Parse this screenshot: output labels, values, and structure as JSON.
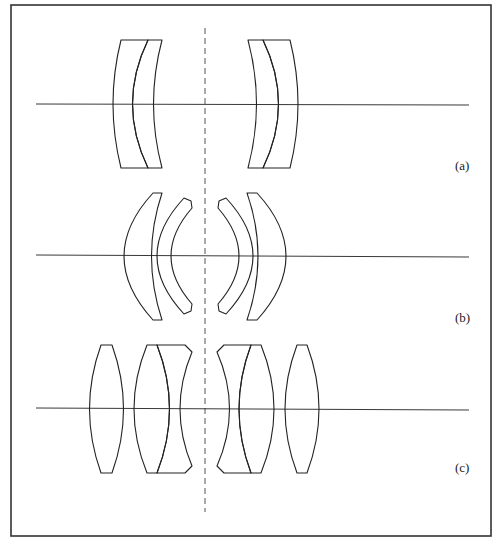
{
  "figure": {
    "panels": [
      {
        "id": "a",
        "label": "(a)",
        "description": "Two cemented meniscus doublets, symmetric about the stop"
      },
      {
        "id": "b",
        "label": "(b)",
        "description": "Two separated meniscus pairs, symmetric about the stop"
      },
      {
        "id": "c",
        "label": "(c)",
        "description": "Outer biconvex singlets with inner cemented doublets, symmetric about the stop"
      }
    ],
    "colors": {
      "stroke": "#222222",
      "frame": "#333333",
      "background": "#ffffff"
    }
  }
}
